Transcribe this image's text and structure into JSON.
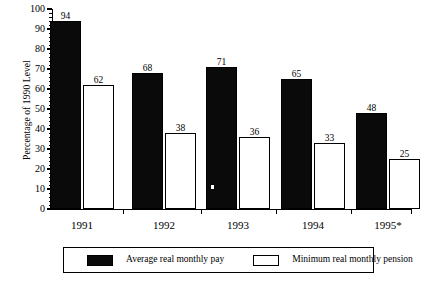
{
  "chart_data": {
    "type": "bar",
    "title": "",
    "xlabel": "",
    "ylabel": "Percentage of 1990 Level",
    "categories": [
      "1991",
      "1992",
      "1993",
      "1994",
      "1995*"
    ],
    "series": [
      {
        "name": "Average real monthly pay",
        "color": "#000000",
        "fill": "solid",
        "values": [
          94,
          68,
          71,
          65,
          48
        ]
      },
      {
        "name": "Minimum real monthly pension",
        "color": "#ffffff",
        "fill": "hollow",
        "values": [
          62,
          38,
          36,
          33,
          25
        ]
      }
    ],
    "ylim": [
      0,
      100
    ],
    "ytick_labels": [
      "0",
      "10",
      "20",
      "30",
      "40",
      "50",
      "60",
      "70",
      "80",
      "90",
      "100"
    ],
    "ytick_values": [
      0,
      10,
      20,
      30,
      40,
      50,
      60,
      70,
      80,
      90,
      100
    ],
    "yminor_step": 2,
    "grid": false,
    "value_labels": true,
    "legend_position": "bottom"
  },
  "legend": {
    "items": [
      {
        "label": "Average real monthly pay",
        "swatch": "dark"
      },
      {
        "label": "Minimum real monthly pension",
        "swatch": "light"
      }
    ]
  }
}
